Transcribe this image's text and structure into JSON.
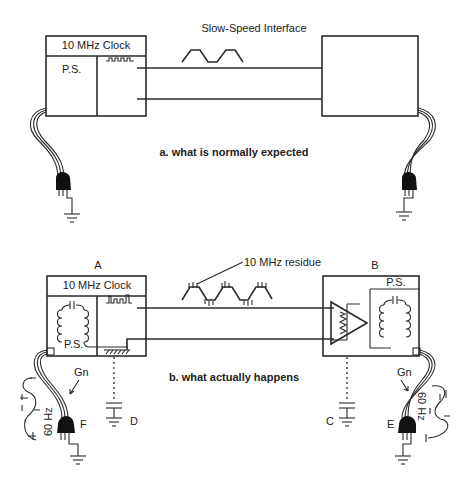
{
  "figure_a": {
    "clock_label": "10 MHz Clock",
    "ps_label": "P.S.",
    "interface_label": "Slow-Speed Interface",
    "caption": "a. what is normally expected"
  },
  "figure_b": {
    "device_a_label": "A",
    "device_b_label": "B",
    "clock_label": "10 MHz Clock",
    "ps_label_a": "P.S.",
    "ps_label_b": "P.S.",
    "residue_label": "10 MHz residue",
    "caption": "b. what actually happens",
    "gn_left": "Gn",
    "gn_right": "Gn",
    "hz_left": "60 Hz",
    "hz_right": "60 Hz",
    "point_c": "C",
    "point_d": "D",
    "point_e": "E",
    "point_f": "F"
  },
  "colors": {
    "line": "#2a2a2a",
    "plug": "#111111",
    "background": "#ffffff"
  }
}
